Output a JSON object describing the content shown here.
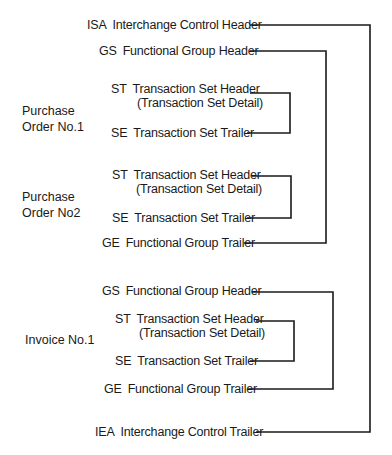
{
  "segments": {
    "isa": {
      "code": "ISA",
      "text": "Interchange Control Header"
    },
    "gs1": {
      "code": "GS",
      "text": "Functional Group Header"
    },
    "st1": {
      "code": "ST",
      "text": "Transaction Set Header",
      "detail": "(Transaction Set Detail)"
    },
    "se1": {
      "code": "SE",
      "text": "Transaction Set Trailer"
    },
    "st2": {
      "code": "ST",
      "text": "Transaction Set Header",
      "detail": "(Transaction Set Detail)"
    },
    "se2": {
      "code": "SE",
      "text": "Transaction Set Trailer"
    },
    "ge1": {
      "code": "GE",
      "text": "Functional Group Trailer"
    },
    "gs2": {
      "code": "GS",
      "text": "Functional Group Header"
    },
    "st3": {
      "code": "ST",
      "text": "Transaction Set Header",
      "detail": "(Transaction Set Detail)"
    },
    "se3": {
      "code": "SE",
      "text": "Transaction Set Trailer"
    },
    "ge2": {
      "code": "GE",
      "text": "Functional Group Trailer"
    },
    "iea": {
      "code": "IEA",
      "text": "Interchange Control Trailer"
    }
  },
  "groups": {
    "po1": {
      "line1": "Purchase",
      "line2": "Order  No.1"
    },
    "po2": {
      "line1": "Purchase",
      "line2": "Order No2"
    },
    "inv1": {
      "line1": "Invoice No.1"
    }
  }
}
